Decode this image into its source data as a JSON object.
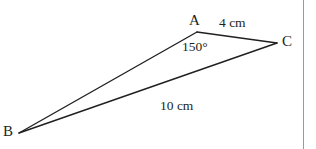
{
  "figure": {
    "type": "geometry-diagram",
    "width": 316,
    "height": 149,
    "background_color": "#ffffff",
    "stroke_color": "#221f20",
    "text_color": "#221f20",
    "border_color": "#9a9a9a",
    "stroke_width": 1.4
  },
  "vertices": {
    "A": {
      "label": "A",
      "x": 197,
      "y": 32,
      "label_x": 189,
      "label_y": 13
    },
    "B": {
      "label": "B",
      "x": 19,
      "y": 133,
      "label_x": 3,
      "label_y": 124
    },
    "C": {
      "label": "C",
      "x": 277,
      "y": 43,
      "label_x": 282,
      "label_y": 34
    }
  },
  "sides": {
    "AB": {
      "from": "A",
      "to": "B",
      "label": ""
    },
    "AC": {
      "from": "A",
      "to": "C",
      "label": "4 cm",
      "label_x": 219,
      "label_y": 16
    },
    "BC": {
      "from": "B",
      "to": "C",
      "label": "10 cm",
      "label_x": 160,
      "label_y": 99
    }
  },
  "angles": {
    "A": {
      "at": "A",
      "label": "150°",
      "value": 150,
      "unit": "degrees",
      "label_x": 182,
      "label_y": 40
    }
  },
  "border": {
    "right_line_x": 303,
    "visible": true
  }
}
